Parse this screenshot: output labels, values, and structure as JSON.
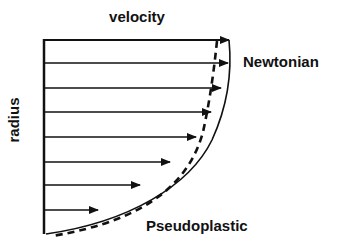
{
  "labels": {
    "x_axis": "velocity",
    "y_axis": "radius",
    "newtonian": "Newtonian",
    "pseudoplastic": "Pseudoplastic"
  },
  "colors": {
    "ink": "#111111",
    "background": "#ffffff"
  },
  "arrows": [
    {
      "y": 40,
      "tip_x": 229
    },
    {
      "y": 63,
      "tip_x": 228
    },
    {
      "y": 88,
      "tip_x": 221
    },
    {
      "y": 112,
      "tip_x": 211
    },
    {
      "y": 137,
      "tip_x": 196
    },
    {
      "y": 162,
      "tip_x": 170
    },
    {
      "y": 185,
      "tip_x": 140
    },
    {
      "y": 210,
      "tip_x": 98
    }
  ],
  "curves": {
    "newtonian": {
      "style": "solid",
      "description": "parabolic velocity profile"
    },
    "pseudoplastic": {
      "style": "dashed",
      "description": "blunted (plug-like) velocity profile"
    }
  }
}
